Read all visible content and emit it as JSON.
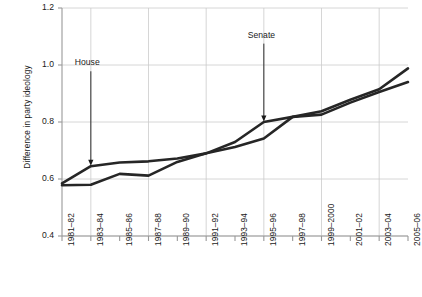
{
  "chart_data": {
    "type": "line",
    "title": "",
    "subtitle": "",
    "xlabel": "",
    "ylabel": "Difference in party ideology",
    "categories": [
      "1981–82",
      "1983–84",
      "1985–86",
      "1987–88",
      "1989–90",
      "1991–92",
      "1993–94",
      "1995–96",
      "1997–98",
      "1999–2000",
      "2001–02",
      "2003–04",
      "2005–06"
    ],
    "ylim": [
      0.4,
      1.2
    ],
    "yticks": [
      "0.4",
      "0.6",
      "0.8",
      "1.0",
      "1.2"
    ],
    "ytick_values": [
      0.4,
      0.6,
      0.8,
      1.0,
      1.2
    ],
    "grid": "both",
    "grid_x_categories": [
      "1983–84",
      "1987–88",
      "1991–92",
      "1995–96",
      "1999–2000",
      "2003–04"
    ],
    "legend_position": "inline-annotations",
    "line_color": "#262626",
    "grid_color": "#cccccc",
    "axis_color": "#999999",
    "series": [
      {
        "name": "House",
        "values": [
          0.585,
          0.645,
          0.658,
          0.662,
          0.672,
          0.69,
          0.712,
          0.742,
          0.818,
          0.826,
          0.868,
          0.905,
          0.94
        ]
      },
      {
        "name": "Senate",
        "values": [
          0.578,
          0.58,
          0.618,
          0.612,
          0.66,
          0.69,
          0.73,
          0.8,
          0.818,
          0.838,
          0.878,
          0.915,
          0.988
        ]
      }
    ],
    "annotations": [
      {
        "label": "House",
        "target_category": "1983–84",
        "target_value": 0.645,
        "text_value": 0.985
      },
      {
        "label": "Senate",
        "target_category": "1995–96",
        "target_value": 0.8,
        "text_value": 1.082
      }
    ]
  }
}
